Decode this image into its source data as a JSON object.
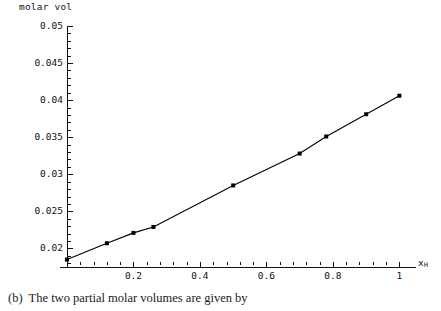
{
  "caption": {
    "label": "(b)",
    "text": "The two partial molar volumes are given by"
  },
  "chart_data": {
    "type": "scatter",
    "title": "molar vol",
    "xlabel": "x",
    "xlabel_sub": "H",
    "ylabel": "molar vol",
    "xlim": [
      0,
      1.05
    ],
    "ylim": [
      0.0175,
      0.05
    ],
    "grid": false,
    "legend": "none",
    "line_connected": true,
    "marker": "square",
    "marker_color": "#000000",
    "line_color": "#000000",
    "x": [
      0.0,
      0.12,
      0.2,
      0.26,
      0.5,
      0.7,
      0.78,
      0.9,
      1.0
    ],
    "y": [
      0.0185,
      0.0207,
      0.0221,
      0.0229,
      0.0285,
      0.0328,
      0.0351,
      0.0381,
      0.0406
    ],
    "xticks": [
      {
        "value": 0.2,
        "label": "0.2"
      },
      {
        "value": 0.4,
        "label": "0.4"
      },
      {
        "value": 0.6,
        "label": "0.6"
      },
      {
        "value": 0.8,
        "label": "0.8"
      },
      {
        "value": 1.0,
        "label": "1"
      }
    ],
    "xminor": [
      0.04,
      0.08,
      0.12,
      0.16,
      0.24,
      0.28,
      0.32,
      0.36,
      0.44,
      0.48,
      0.52,
      0.56,
      0.64,
      0.68,
      0.72,
      0.76,
      0.84,
      0.88,
      0.92,
      0.96
    ],
    "yticks": [
      {
        "value": 0.05,
        "label": "0.05"
      },
      {
        "value": 0.045,
        "label": "0.045"
      },
      {
        "value": 0.04,
        "label": "0.04"
      },
      {
        "value": 0.035,
        "label": "0.035"
      },
      {
        "value": 0.03,
        "label": "0.03"
      },
      {
        "value": 0.025,
        "label": "0.025"
      },
      {
        "value": 0.02,
        "label": "0.02"
      }
    ],
    "yminor": [
      0.049,
      0.048,
      0.047,
      0.046,
      0.044,
      0.043,
      0.042,
      0.041,
      0.039,
      0.038,
      0.037,
      0.036,
      0.034,
      0.033,
      0.032,
      0.031,
      0.029,
      0.028,
      0.027,
      0.026,
      0.024,
      0.023,
      0.022,
      0.021,
      0.019,
      0.018
    ]
  }
}
